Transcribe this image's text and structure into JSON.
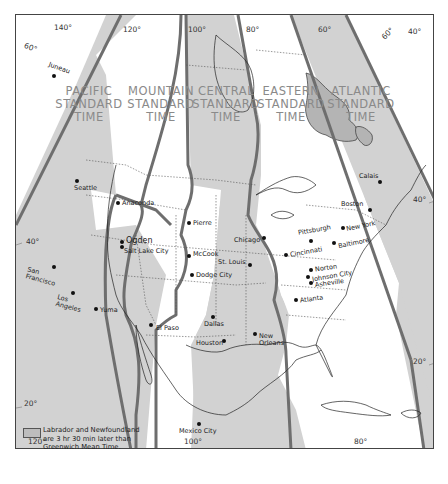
{
  "map": {
    "title": "North American Standard Time Zones",
    "colors": {
      "zone_gray": "#d2d2d2",
      "zone_white": "#ffffff",
      "boundary": "#6e6e6e",
      "labrador_newfoundland": "#b4b4b4",
      "label_text": "#8a8a8a"
    },
    "zones": [
      {
        "id": "pacific",
        "label_line1": "PACIFIC",
        "label_line2": "STANDARD",
        "label_line3": "TIME",
        "fill": "gray"
      },
      {
        "id": "mountain",
        "label_line1": "MOUNTAIN",
        "label_line2": "STANDARD",
        "label_line3": "TIME",
        "fill": "white"
      },
      {
        "id": "central",
        "label_line1": "CENTRAL",
        "label_line2": "STANDARD",
        "label_line3": "TIME",
        "fill": "gray"
      },
      {
        "id": "eastern",
        "label_line1": "EASTERN",
        "label_line2": "STANDARD",
        "label_line3": "TIME",
        "fill": "white"
      },
      {
        "id": "atlantic",
        "label_line1": "ATLANTIC",
        "label_line2": "STANDARD",
        "label_line3": "TIME",
        "fill": "gray"
      }
    ],
    "cities": [
      {
        "name": "Juneau"
      },
      {
        "name": "Seattle"
      },
      {
        "name": "Anaconda"
      },
      {
        "name": "Ogden"
      },
      {
        "name": "Salt Lake City"
      },
      {
        "name": "San Francisco",
        "line1": "San",
        "line2": "Francisco"
      },
      {
        "name": "Los Angeles",
        "line1": "Los",
        "line2": "Angeles"
      },
      {
        "name": "Yuma"
      },
      {
        "name": "Pierre"
      },
      {
        "name": "McCook"
      },
      {
        "name": "Dodge City"
      },
      {
        "name": "Chicago"
      },
      {
        "name": "St. Louis"
      },
      {
        "name": "Dallas"
      },
      {
        "name": "Houston"
      },
      {
        "name": "New Orleans",
        "line1": "New",
        "line2": "Orleans"
      },
      {
        "name": "El Paso"
      },
      {
        "name": "Mexico City"
      },
      {
        "name": "Calais"
      },
      {
        "name": "Boston"
      },
      {
        "name": "New York"
      },
      {
        "name": "Pittsburgh"
      },
      {
        "name": "Baltimore"
      },
      {
        "name": "Cincinnati"
      },
      {
        "name": "Norton"
      },
      {
        "name": "Johnson City"
      },
      {
        "name": "Asheville"
      },
      {
        "name": "Atlanta"
      }
    ],
    "graticule_labels": {
      "top": [
        "140°",
        "120°",
        "100°",
        "80°",
        "60°",
        "60°",
        "40°"
      ],
      "left": [
        "60°",
        "40°",
        "20°"
      ],
      "right": [
        "40°",
        "20°"
      ],
      "bottom": [
        "120°",
        "100°",
        "80°"
      ]
    },
    "legend": {
      "line1": "Labrador and Newfoundland",
      "line2": "are 3 hr 30 min later than",
      "line3": "Greenwich Mean Time."
    }
  }
}
